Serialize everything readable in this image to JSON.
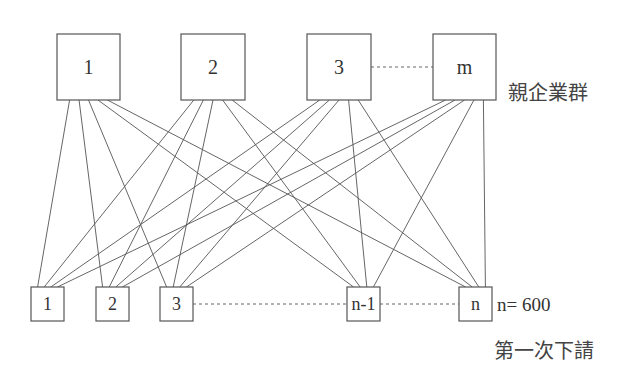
{
  "diagram": {
    "type": "complete-bipartite-network",
    "parent_group": {
      "label": "親企業群",
      "nodes": [
        {
          "id": "p1",
          "label": "1",
          "x": 57,
          "y": 34,
          "w": 63,
          "h": 66
        },
        {
          "id": "p2",
          "label": "2",
          "x": 181,
          "y": 34,
          "w": 64,
          "h": 66
        },
        {
          "id": "p3",
          "label": "3",
          "x": 307,
          "y": 34,
          "w": 64,
          "h": 66
        },
        {
          "id": "pm",
          "label": "m",
          "x": 433,
          "y": 34,
          "w": 63,
          "h": 66
        }
      ],
      "ellipsis_between": [
        "p3",
        "pm"
      ]
    },
    "subcontractor_group": {
      "label": "第一次下請",
      "count_label": "n= 600",
      "nodes": [
        {
          "id": "s1",
          "label": "1",
          "x": 31,
          "y": 287,
          "w": 33,
          "h": 34
        },
        {
          "id": "s2",
          "label": "2",
          "x": 96,
          "y": 287,
          "w": 33,
          "h": 34
        },
        {
          "id": "s3",
          "label": "3",
          "x": 160,
          "y": 287,
          "w": 33,
          "h": 34
        },
        {
          "id": "sn1",
          "label": "n-1",
          "x": 347,
          "y": 287,
          "w": 33,
          "h": 34
        },
        {
          "id": "sn",
          "label": "n",
          "x": 459,
          "y": 287,
          "w": 33,
          "h": 34
        }
      ],
      "ellipsis_between": [
        [
          "s3",
          "sn1"
        ],
        [
          "sn1",
          "sn"
        ]
      ]
    },
    "edges_rule": "every parent node connects to every first-tier subcontractor node",
    "edge_count": 20,
    "colors": {
      "stroke": "#555555",
      "text": "#333333",
      "background": "#ffffff"
    }
  }
}
